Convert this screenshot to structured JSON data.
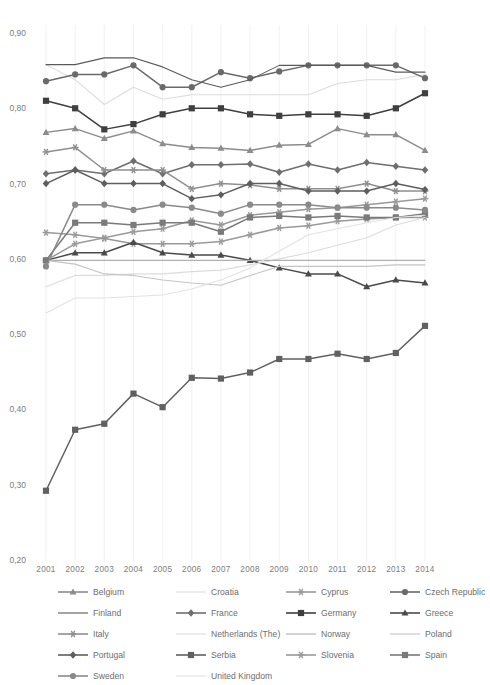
{
  "chart_data": {
    "type": "line",
    "title": "",
    "xlabel": "",
    "ylabel": "",
    "categories": [
      "2001",
      "2002",
      "2003",
      "2004",
      "2005",
      "2006",
      "2007",
      "2008",
      "2009",
      "2010",
      "2011",
      "2012",
      "2013",
      "2014"
    ],
    "xtick_labels": [
      "2001",
      "2002",
      "2003",
      "2004",
      "2005",
      "2006",
      "2007",
      "2008",
      "2009",
      "2010",
      "2011",
      "2012",
      "2013",
      "2014"
    ],
    "ytick_labels": [
      "0,90",
      "0,80",
      "0,70",
      "0,60",
      "0,50",
      "0,40",
      "0,30",
      "0,20"
    ],
    "ytick_values": [
      0.9,
      0.8,
      0.7,
      0.6,
      0.5,
      0.4,
      0.3,
      0.2
    ],
    "ylim": [
      0.2,
      0.9
    ],
    "xlim": [
      2001,
      2014
    ],
    "grid": "vertical-only",
    "legend_position": "bottom",
    "legend_columns": 4,
    "series": [
      {
        "name": "Belgium",
        "marker": "triangle",
        "color": "#8c8c8c",
        "values": [
          0.768,
          0.773,
          0.76,
          0.77,
          0.753,
          0.748,
          0.747,
          0.744,
          0.751,
          0.752,
          0.773,
          0.765,
          0.765,
          0.744
        ]
      },
      {
        "name": "Croatia",
        "marker": "none",
        "color": "#dcdcdc",
        "values": [
          0.858,
          0.838,
          0.805,
          0.828,
          0.812,
          0.818,
          0.818,
          0.818,
          0.818,
          0.818,
          0.833,
          0.838,
          0.838,
          0.845
        ]
      },
      {
        "name": "Cyprus",
        "marker": "asterisk",
        "color": "#9a9a9a",
        "values": [
          0.635,
          0.632,
          0.627,
          0.62,
          0.62,
          0.62,
          0.623,
          0.632,
          0.641,
          0.644,
          0.65,
          0.653,
          0.655,
          0.655
        ]
      },
      {
        "name": "Czech Republic",
        "marker": "circle",
        "color": "#6a6a6a",
        "values": [
          0.836,
          0.845,
          0.845,
          0.857,
          0.828,
          0.828,
          0.848,
          0.84,
          0.849,
          0.857,
          0.857,
          0.857,
          0.857,
          0.84
        ]
      },
      {
        "name": "Finland",
        "marker": "none",
        "color": "#5a5a5a",
        "values": [
          0.858,
          0.858,
          0.867,
          0.867,
          0.855,
          0.838,
          0.828,
          0.838,
          0.857,
          0.857,
          0.857,
          0.857,
          0.848,
          0.848
        ]
      },
      {
        "name": "France",
        "marker": "diamond",
        "color": "#6f6f6f",
        "values": [
          0.713,
          0.718,
          0.713,
          0.73,
          0.713,
          0.725,
          0.725,
          0.726,
          0.715,
          0.726,
          0.718,
          0.728,
          0.723,
          0.718
        ]
      },
      {
        "name": "Germany",
        "marker": "square",
        "color": "#3f3f3f",
        "values": [
          0.81,
          0.8,
          0.772,
          0.779,
          0.792,
          0.8,
          0.8,
          0.792,
          0.79,
          0.792,
          0.792,
          0.79,
          0.8,
          0.82
        ]
      },
      {
        "name": "Greece",
        "marker": "triangle",
        "color": "#4a4a4a",
        "values": [
          0.598,
          0.608,
          0.608,
          0.622,
          0.608,
          0.605,
          0.605,
          0.598,
          0.588,
          0.58,
          0.58,
          0.563,
          0.572,
          0.568
        ]
      },
      {
        "name": "Italy",
        "marker": "asterisk",
        "color": "#8f8f8f",
        "values": [
          0.742,
          0.748,
          0.718,
          0.718,
          0.718,
          0.693,
          0.7,
          0.698,
          0.693,
          0.693,
          0.693,
          0.7,
          0.69,
          0.69
        ]
      },
      {
        "name": "Netherlands (The)",
        "marker": "none",
        "color": "#dcdcdc",
        "values": [
          0.563,
          0.578,
          0.578,
          0.58,
          0.58,
          0.583,
          0.585,
          0.592,
          0.6,
          0.608,
          0.618,
          0.628,
          0.645,
          0.655
        ]
      },
      {
        "name": "Norway",
        "marker": "none",
        "color": "#b0b0b0",
        "values": [
          0.598,
          0.598,
          0.598,
          0.598,
          0.598,
          0.598,
          0.598,
          0.598,
          0.598,
          0.598,
          0.598,
          0.598,
          0.598,
          0.598
        ]
      },
      {
        "name": "Poland",
        "marker": "none",
        "color": "#c4c4c4",
        "values": [
          0.598,
          0.593,
          0.58,
          0.578,
          0.572,
          0.568,
          0.565,
          0.578,
          0.59,
          0.59,
          0.59,
          0.59,
          0.592,
          0.592
        ]
      },
      {
        "name": "Portugal",
        "marker": "diamond",
        "color": "#5e5e5e",
        "values": [
          0.7,
          0.718,
          0.7,
          0.7,
          0.7,
          0.68,
          0.685,
          0.7,
          0.7,
          0.69,
          0.69,
          0.69,
          0.7,
          0.692
        ]
      },
      {
        "name": "Serbia",
        "marker": "square",
        "color": "#606060",
        "values": [
          0.292,
          0.373,
          0.381,
          0.421,
          0.403,
          0.442,
          0.441,
          0.449,
          0.467,
          0.467,
          0.474,
          0.467,
          0.475,
          0.511
        ]
      },
      {
        "name": "Slovenia",
        "marker": "asterisk",
        "color": "#9a9a9a",
        "values": [
          0.598,
          0.62,
          0.628,
          0.636,
          0.64,
          0.651,
          0.645,
          0.658,
          0.662,
          0.666,
          0.668,
          0.672,
          0.676,
          0.68
        ]
      },
      {
        "name": "Spain",
        "marker": "square",
        "color": "#7a7a7a",
        "values": [
          0.598,
          0.648,
          0.648,
          0.645,
          0.648,
          0.648,
          0.636,
          0.655,
          0.657,
          0.655,
          0.657,
          0.655,
          0.655,
          0.66
        ]
      },
      {
        "name": "Sweden",
        "marker": "circle",
        "color": "#8a8a8a",
        "values": [
          0.59,
          0.672,
          0.672,
          0.665,
          0.672,
          0.668,
          0.66,
          0.672,
          0.672,
          0.672,
          0.668,
          0.668,
          0.668,
          0.665
        ]
      },
      {
        "name": "United Kingdom",
        "marker": "none",
        "color": "#e2e2e2",
        "values": [
          0.528,
          0.548,
          0.548,
          0.55,
          0.552,
          0.56,
          0.572,
          0.588,
          0.61,
          0.632,
          0.64,
          0.648,
          0.655,
          0.658
        ]
      }
    ]
  },
  "legend": {
    "items": [
      {
        "label": "Belgium"
      },
      {
        "label": "Croatia"
      },
      {
        "label": "Cyprus"
      },
      {
        "label": "Czech Republic"
      },
      {
        "label": "Finland"
      },
      {
        "label": "France"
      },
      {
        "label": "Germany"
      },
      {
        "label": "Greece"
      },
      {
        "label": "Italy"
      },
      {
        "label": "Netherlands (The)"
      },
      {
        "label": "Norway"
      },
      {
        "label": "Poland"
      },
      {
        "label": "Portugal"
      },
      {
        "label": "Serbia"
      },
      {
        "label": "Slovenia"
      },
      {
        "label": "Spain"
      },
      {
        "label": "Sweden"
      },
      {
        "label": "United Kingdom"
      }
    ]
  }
}
